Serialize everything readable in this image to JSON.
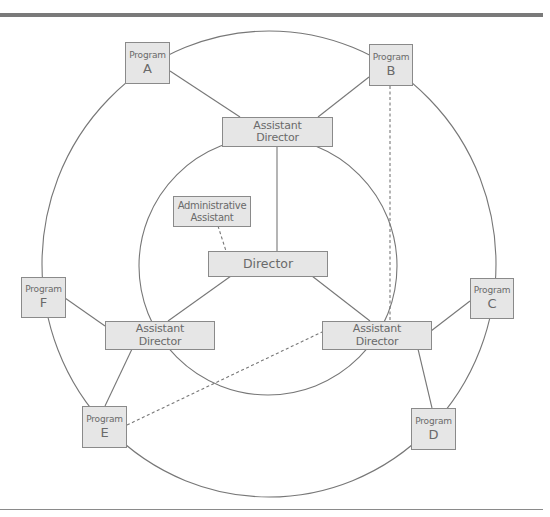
{
  "diagram": {
    "type": "organizational-structure",
    "colors": {
      "node_fill": "#e6e6e6",
      "node_border": "#8a8a8a",
      "text": "#6a6a6a",
      "line": "#777777",
      "rule": "#7a7a7a"
    },
    "nodes": {
      "director": {
        "label": "Director"
      },
      "admin_assistant": {
        "line1": "Administrative",
        "line2": "Assistant"
      },
      "ad_top": {
        "line1": "Assistant",
        "line2": "Director"
      },
      "ad_left": {
        "line1": "Assistant",
        "line2": "Director"
      },
      "ad_right": {
        "line1": "Assistant",
        "line2": "Director"
      },
      "program_a": {
        "line1": "Program",
        "line2": "A"
      },
      "program_b": {
        "line1": "Program",
        "line2": "B"
      },
      "program_c": {
        "line1": "Program",
        "line2": "C"
      },
      "program_d": {
        "line1": "Program",
        "line2": "D"
      },
      "program_e": {
        "line1": "Program",
        "line2": "E"
      },
      "program_f": {
        "line1": "Program",
        "line2": "F"
      }
    },
    "edges": [
      {
        "from": "Director",
        "to": "Assistant Director (top)",
        "style": "solid"
      },
      {
        "from": "Director",
        "to": "Assistant Director (left)",
        "style": "solid"
      },
      {
        "from": "Director",
        "to": "Assistant Director (right)",
        "style": "solid"
      },
      {
        "from": "Director",
        "to": "Administrative Assistant",
        "style": "dashed"
      },
      {
        "from": "Assistant Director (top)",
        "to": "Program A",
        "style": "solid"
      },
      {
        "from": "Assistant Director (top)",
        "to": "Program B",
        "style": "solid"
      },
      {
        "from": "Assistant Director (left)",
        "to": "Program F",
        "style": "solid"
      },
      {
        "from": "Assistant Director (left)",
        "to": "Program E",
        "style": "solid"
      },
      {
        "from": "Assistant Director (right)",
        "to": "Program C",
        "style": "solid"
      },
      {
        "from": "Assistant Director (right)",
        "to": "Program D",
        "style": "solid"
      },
      {
        "from": "Program B",
        "to": "Assistant Director (right)",
        "style": "dashed"
      },
      {
        "from": "Program E",
        "to": "Assistant Director (right)",
        "style": "dashed"
      }
    ],
    "rings": [
      {
        "name": "outer-ring",
        "connects": [
          "Program A",
          "Program B",
          "Program C",
          "Program D",
          "Program E",
          "Program F"
        ]
      },
      {
        "name": "inner-ring",
        "connects": [
          "Assistant Director (top)",
          "Assistant Director (left)",
          "Assistant Director (right)"
        ]
      }
    ]
  }
}
